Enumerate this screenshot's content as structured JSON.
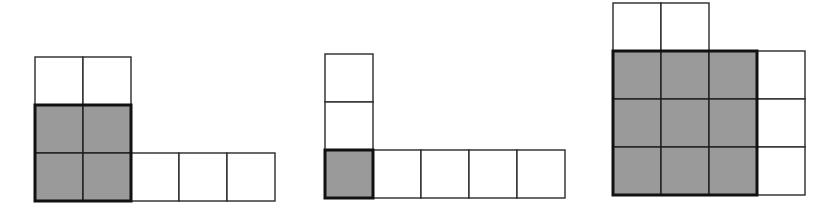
{
  "diagram": {
    "title": "",
    "background": "#ffffff",
    "colors": {
      "shaded": "#9a9a9a",
      "unshaded": "#ffffff",
      "line": "#2a2a2a",
      "outline": "#111111"
    },
    "cell_size": 48,
    "figures": [
      {
        "id": "figure-1",
        "description": "2x2 shaded square with 2 white cells above and 3 white cells to the right of bottom row",
        "origin": [
          35,
          57
        ],
        "shaded_block": {
          "col": 0,
          "row": 1,
          "cols": 2,
          "rows": 2
        },
        "white_cells": [
          [
            0,
            0
          ],
          [
            1,
            0
          ],
          [
            2,
            2
          ],
          [
            3,
            2
          ],
          [
            4,
            2
          ]
        ],
        "shaded_cells": [
          [
            0,
            1
          ],
          [
            1,
            1
          ],
          [
            0,
            2
          ],
          [
            1,
            2
          ]
        ]
      },
      {
        "id": "figure-2",
        "description": "1x1 shaded square with 2 white cells above and 4 white cells to the right",
        "origin": [
          325,
          54
        ],
        "shaded_block": {
          "col": 0,
          "row": 2,
          "cols": 1,
          "rows": 1
        },
        "white_cells": [
          [
            0,
            0
          ],
          [
            0,
            1
          ],
          [
            1,
            2
          ],
          [
            2,
            2
          ],
          [
            3,
            2
          ],
          [
            4,
            2
          ]
        ],
        "shaded_cells": [
          [
            0,
            2
          ]
        ]
      },
      {
        "id": "figure-3",
        "description": "3x3 shaded square with 2 white cells above and 3 white cells to the right",
        "origin": [
          613,
          3
        ],
        "shaded_block": {
          "col": 0,
          "row": 1,
          "cols": 3,
          "rows": 3
        },
        "white_cells": [
          [
            0,
            0
          ],
          [
            1,
            0
          ],
          [
            3,
            1
          ],
          [
            3,
            2
          ],
          [
            3,
            3
          ]
        ],
        "shaded_cells": [
          [
            0,
            1
          ],
          [
            1,
            1
          ],
          [
            2,
            1
          ],
          [
            0,
            2
          ],
          [
            1,
            2
          ],
          [
            2,
            2
          ],
          [
            0,
            3
          ],
          [
            1,
            3
          ],
          [
            2,
            3
          ]
        ]
      }
    ]
  }
}
